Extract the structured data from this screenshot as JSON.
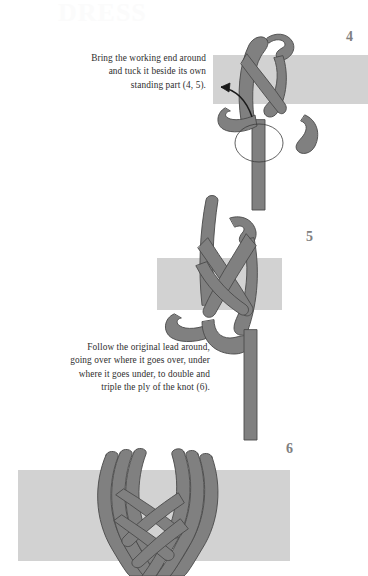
{
  "page": {
    "watermark": "DRESS",
    "background_color": "#ffffff",
    "rope_color": "#808080",
    "rope_outline_color": "#4a4a4a",
    "band_color": "#d2d2d2",
    "step_number_color": "#808080",
    "text_color": "#2e2e2e"
  },
  "captions": {
    "steps_4_5": "Bring the working end around and tuck it beside its own standing part (4, 5).",
    "steps_4_5_lines": [
      "Bring the working end around",
      "and tuck it beside its own",
      "standing part (4, 5)."
    ],
    "step_6": "Follow the original lead around, going over where it goes over, under where it goes under, to double and triple the ply of the knot (6).",
    "step_6_lines": [
      "Follow the original lead around,",
      "going over where it goes over, under",
      "where it goes under, to double and",
      "triple the ply of the knot (6)."
    ]
  },
  "steps": [
    {
      "number": "4",
      "label": "Step 4 illustration",
      "description": "Partially tied knot on a vertical rope crossing a horizontal gray band, with a curved arrow pointing left and a thin ellipse indicating the wrap direction."
    },
    {
      "number": "5",
      "label": "Step 5 illustration",
      "description": "Knot with the working end tucked beside its standing part, crossing a horizontal gray band, long tail hanging below."
    },
    {
      "number": "6",
      "label": "Step 6 illustration",
      "description": "Finished doubled and tripled Turk's head knot woven around a horizontal gray band."
    }
  ]
}
